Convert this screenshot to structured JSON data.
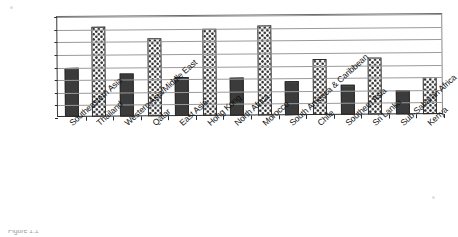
{
  "chart_data": {
    "type": "bar",
    "title": "",
    "subtitle": "",
    "xlabel": "",
    "ylabel": "",
    "ylim": [
      0,
      80
    ],
    "yticks": [
      0,
      10,
      20,
      30,
      40,
      50,
      60,
      70,
      80
    ],
    "grid": true,
    "legend": "none",
    "legend_position": "none",
    "categories": [
      "Southeastern Asia",
      "Thailand",
      "Western Asia/Middle East",
      "Qatar",
      "East Asia",
      "Hong Kong",
      "North Africa",
      "Morocco",
      "South America & Caribbean",
      "Chile",
      "Southern Asia",
      "Sri Lanka",
      "Sub-Saharan Africa",
      "Kenya"
    ],
    "values": [
      39,
      71,
      34,
      62,
      31,
      69,
      30,
      71,
      27,
      44,
      24,
      45,
      19,
      29
    ],
    "fills": [
      "solid",
      "check",
      "solid",
      "check",
      "solid",
      "check",
      "solid",
      "check",
      "solid",
      "check",
      "solid",
      "check",
      "solid",
      "check"
    ]
  },
  "caption": {
    "fragment": "Figure 1.1"
  },
  "colors": {
    "bar_solid": "#3b3b3b",
    "bar_check_dot": "#2e2e2e",
    "bar_check_bg": "#fdfdfd",
    "gridline": "#9a9a9a",
    "axis": "#2b2b2b",
    "text": "#101010",
    "background": "#ffffff"
  }
}
